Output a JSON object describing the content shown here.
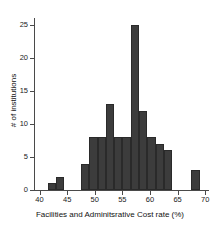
{
  "chart_data": {
    "type": "bar",
    "title": "",
    "subtitle": "",
    "xlabel": "Facilities and Adminitsrative Cost rate (%)",
    "ylabel": "# of institutions",
    "xlim": [
      39.0,
      70.5
    ],
    "ylim": [
      0,
      25.8
    ],
    "grid": false,
    "legend": null,
    "bin_width": 1.5,
    "categories": [
      "41.5",
      "43.0",
      "47.5",
      "49.0",
      "50.5",
      "52.0",
      "53.5",
      "55.0",
      "56.5",
      "58.0",
      "59.5",
      "61.0",
      "62.5",
      "67.5"
    ],
    "bin_starts": [
      41.5,
      43.0,
      47.5,
      49.0,
      50.5,
      52.0,
      53.5,
      55.0,
      56.5,
      58.0,
      59.5,
      61.0,
      62.5,
      67.5
    ],
    "values": [
      1,
      2,
      4,
      8,
      8,
      13,
      8,
      8,
      25,
      12,
      8,
      7,
      6,
      3
    ],
    "x_ticks": [
      40,
      45,
      50,
      55,
      60,
      65,
      70
    ],
    "x_tick_labels": [
      "40",
      "45",
      "50",
      "55",
      "60",
      "65",
      "70"
    ],
    "y_ticks": [
      0,
      5,
      10,
      15,
      20,
      25
    ],
    "y_tick_labels": [
      "0",
      "5",
      "10",
      "15",
      "20",
      "25"
    ],
    "bar_color": "#3c3c3c",
    "bar_edge_color": "#2a2a2a",
    "axis_color": "#4a4a4a",
    "background_color": "#ffffff"
  }
}
